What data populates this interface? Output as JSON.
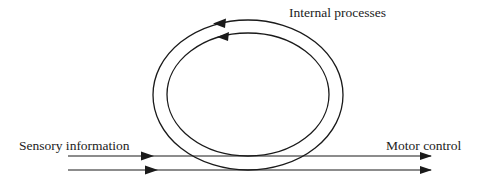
{
  "diagram": {
    "labels": {
      "internal": "Internal processes",
      "sensory": "Sensory information",
      "motor": "Motor control"
    },
    "nodes": [
      {
        "id": "sensory",
        "label": "Sensory information",
        "role": "input"
      },
      {
        "id": "internal",
        "label": "Internal processes",
        "role": "loop"
      },
      {
        "id": "motor",
        "label": "Motor control",
        "role": "output"
      }
    ],
    "edges": [
      {
        "from": "sensory",
        "to": "motor",
        "type": "straight-arrow",
        "count": 2
      },
      {
        "from": "internal",
        "to": "internal",
        "type": "loop-arrow",
        "direction": "counter-clockwise",
        "count": 2
      }
    ],
    "colors": {
      "stroke": "#1a1a1a",
      "background": "#ffffff"
    }
  }
}
